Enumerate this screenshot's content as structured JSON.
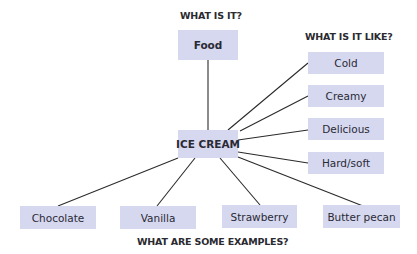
{
  "diagram": {
    "center": {
      "label": "ICE CREAM"
    },
    "headings": {
      "what_is_it": "WHAT IS IT?",
      "what_is_it_like": "WHAT IS IT LIKE?",
      "examples": "WHAT ARE SOME EXAMPLES?"
    },
    "category": {
      "label": "Food"
    },
    "attributes": [
      {
        "label": "Cold"
      },
      {
        "label": "Creamy"
      },
      {
        "label": "Delicious"
      },
      {
        "label": "Hard/soft"
      }
    ],
    "examples": [
      {
        "label": "Chocolate"
      },
      {
        "label": "Vanilla"
      },
      {
        "label": "Strawberry"
      },
      {
        "label": "Butter pecan"
      }
    ],
    "colors": {
      "box_fill": "#d6d8f0",
      "line": "#2a2a2a",
      "text": "#2a2a35"
    }
  }
}
